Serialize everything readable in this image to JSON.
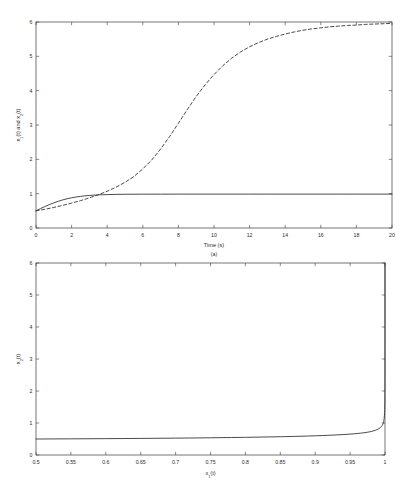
{
  "figure": {
    "background": "#ffffff",
    "line_color": "#2b2b2b",
    "axis_color": "#3a3a3a",
    "width": 409,
    "height": 503
  },
  "chart_data": [
    {
      "type": "line",
      "panel_id": "a",
      "caption": "(a)",
      "title": "",
      "xlabel": "Time (s)",
      "ylabel": "x₁(t) and x₂(t)",
      "ylabel_parts": {
        "v1": "x",
        "s1": "1",
        "v1b": "(t) and ",
        "v2": "x",
        "s2": "2",
        "v2b": "(t)"
      },
      "xlim": [
        0,
        20
      ],
      "ylim": [
        0,
        6
      ],
      "xticks": [
        0,
        2,
        4,
        6,
        8,
        10,
        12,
        14,
        16,
        18,
        20
      ],
      "xtick_labels": [
        "0",
        "2",
        "4",
        "6",
        "8",
        "10",
        "12",
        "14",
        "16",
        "18",
        "20"
      ],
      "yticks": [
        0,
        1,
        2,
        3,
        4,
        5,
        6
      ],
      "ytick_labels": [
        "0",
        "1",
        "2",
        "3",
        "4",
        "5",
        "6"
      ],
      "grid": false,
      "legend": null,
      "series": [
        {
          "name": "x1(t)",
          "style": "solid",
          "color": "#2b2b2b",
          "x": [
            0,
            0.25,
            0.5,
            0.75,
            1,
            1.25,
            1.5,
            1.75,
            2,
            2.25,
            2.5,
            2.75,
            3,
            3.25,
            3.5,
            3.75,
            4,
            4.5,
            5,
            5.5,
            6,
            7,
            8,
            9,
            10,
            11,
            12,
            13,
            14,
            15,
            16,
            17,
            18,
            19,
            20
          ],
          "y": [
            0.5,
            0.565,
            0.625,
            0.681,
            0.732,
            0.778,
            0.818,
            0.852,
            0.88,
            0.903,
            0.921,
            0.936,
            0.948,
            0.957,
            0.964,
            0.969,
            0.973,
            0.979,
            0.982,
            0.984,
            0.985,
            0.986,
            0.987,
            0.987,
            0.987,
            0.987,
            0.987,
            0.987,
            0.987,
            0.987,
            0.987,
            0.987,
            0.987,
            0.987,
            0.987
          ]
        },
        {
          "name": "x2(t)",
          "style": "dashed",
          "color": "#2b2b2b",
          "x": [
            0,
            0.5,
            1,
            1.5,
            2,
            2.5,
            3,
            3.5,
            4,
            4.5,
            5,
            5.5,
            6,
            6.5,
            7,
            7.5,
            8,
            8.5,
            9,
            9.5,
            10,
            10.5,
            11,
            11.5,
            12,
            12.5,
            13,
            13.5,
            14,
            14.5,
            15,
            15.5,
            16,
            16.5,
            17,
            17.5,
            18,
            18.5,
            19,
            19.5,
            20
          ],
          "y": [
            0.5,
            0.545,
            0.598,
            0.658,
            0.724,
            0.797,
            0.878,
            0.968,
            1.07,
            1.19,
            1.33,
            1.5,
            1.72,
            1.98,
            2.3,
            2.66,
            3.05,
            3.45,
            3.83,
            4.17,
            4.47,
            4.73,
            4.95,
            5.13,
            5.28,
            5.4,
            5.5,
            5.58,
            5.65,
            5.71,
            5.76,
            5.8,
            5.83,
            5.86,
            5.88,
            5.9,
            5.91,
            5.93,
            5.94,
            5.95,
            5.96
          ]
        }
      ]
    },
    {
      "type": "line",
      "panel_id": "b",
      "caption": "",
      "title": "",
      "xlabel": "x₁(t)",
      "xlabel_parts": {
        "v": "x",
        "s": "1",
        "tail": "(t)"
      },
      "ylabel": "x₂(t)",
      "ylabel_parts": {
        "v": "x",
        "s": "2",
        "tail": "(t)"
      },
      "xlim": [
        0.5,
        1
      ],
      "ylim": [
        0,
        6
      ],
      "xticks": [
        0.5,
        0.55,
        0.6,
        0.65,
        0.7,
        0.75,
        0.8,
        0.85,
        0.9,
        0.95,
        1
      ],
      "xtick_labels": [
        "0.5",
        "0.55",
        "0.6",
        "0.65",
        "0.7",
        "0.75",
        "0.8",
        "0.85",
        "0.9",
        "0.95",
        "1"
      ],
      "yticks": [
        0,
        1,
        2,
        3,
        4,
        5,
        6
      ],
      "ytick_labels": [
        "0",
        "1",
        "2",
        "3",
        "4",
        "5",
        "6"
      ],
      "grid": false,
      "legend": null,
      "series": [
        {
          "name": "phase-trajectory",
          "style": "solid",
          "color": "#2b2b2b",
          "x": [
            0.5,
            0.55,
            0.6,
            0.65,
            0.7,
            0.72,
            0.75,
            0.78,
            0.8,
            0.83,
            0.85,
            0.87,
            0.89,
            0.9,
            0.91,
            0.92,
            0.93,
            0.94,
            0.95,
            0.955,
            0.96,
            0.965,
            0.97,
            0.974,
            0.978,
            0.981,
            0.984,
            0.9865,
            0.9885,
            0.99,
            0.9915,
            0.9928,
            0.9938,
            0.9946,
            0.9953,
            0.9959,
            0.9964,
            0.9969,
            0.9973,
            0.9977,
            0.998,
            0.9983,
            0.9986,
            0.9988,
            0.999,
            0.9992,
            0.9993,
            0.9994,
            0.9995,
            0.99957,
            0.99964,
            0.9997,
            0.99975,
            0.9998,
            0.99984,
            0.99988,
            0.99991,
            0.99994,
            0.99996,
            0.99998,
            0.99999,
            1.0
          ],
          "y": [
            0.5,
            0.505,
            0.511,
            0.518,
            0.527,
            0.531,
            0.538,
            0.546,
            0.552,
            0.563,
            0.571,
            0.581,
            0.593,
            0.6,
            0.608,
            0.617,
            0.627,
            0.639,
            0.653,
            0.661,
            0.671,
            0.682,
            0.695,
            0.708,
            0.724,
            0.739,
            0.757,
            0.775,
            0.792,
            0.808,
            0.827,
            0.847,
            0.865,
            0.883,
            0.9,
            0.92,
            0.938,
            0.962,
            0.986,
            1.015,
            1.042,
            1.075,
            1.115,
            1.15,
            1.19,
            1.245,
            1.285,
            1.33,
            1.385,
            1.42,
            1.47,
            1.53,
            1.59,
            1.67,
            1.75,
            1.85,
            1.96,
            2.12,
            2.3,
            2.6,
            3.0,
            6.0
          ]
        }
      ]
    }
  ]
}
